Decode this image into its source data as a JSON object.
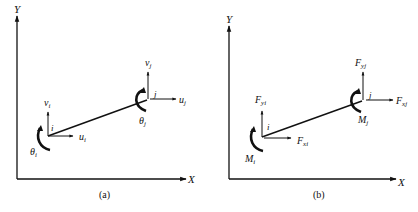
{
  "panels": [
    {
      "caption": "(a)",
      "axes": {
        "x_label": "X",
        "y_label": "Y"
      },
      "node_i": {
        "name": "i",
        "horizontal": "u",
        "horizontal_sub": "i",
        "vertical": "v",
        "vertical_sub": "i",
        "rotation": "θ",
        "rotation_sub": "i"
      },
      "node_j": {
        "name": "j",
        "horizontal": "u",
        "horizontal_sub": "j",
        "vertical": "v",
        "vertical_sub": "j",
        "rotation": "θ",
        "rotation_sub": "j"
      }
    },
    {
      "caption": "(b)",
      "axes": {
        "x_label": "X",
        "y_label": "Y"
      },
      "node_i": {
        "name": "i",
        "horizontal": "F",
        "horizontal_sub": "xi",
        "vertical": "F",
        "vertical_sub": "yi",
        "rotation": "M",
        "rotation_sub": "i"
      },
      "node_j": {
        "name": "j",
        "horizontal": "F",
        "horizontal_sub": "xj",
        "vertical": "F",
        "vertical_sub": "yj",
        "rotation": "M",
        "rotation_sub": "j"
      }
    }
  ],
  "colors": {
    "ink": "#111111",
    "background": "#ffffff"
  }
}
